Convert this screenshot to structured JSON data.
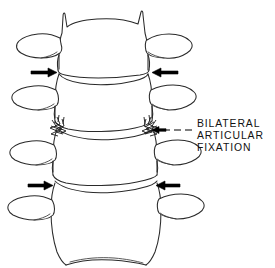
{
  "figure": {
    "background_color": "#ffffff",
    "line_color": "#2a2a2a",
    "arrow_color": "#000000",
    "text_color": "#111111",
    "vertebra_count": 4
  },
  "annotation": {
    "lines": [
      "BILATERAL",
      "ARTICULAR",
      "FIXATION"
    ],
    "line1": "BILATERAL",
    "line2": "ARTICULAR",
    "line3": "FIXATION",
    "leader": "dashed-line-to-left-arrow",
    "points_to": "right-facet-joint-fixation"
  },
  "arrows": [
    {
      "id": "upper-left",
      "direction": "right",
      "label": "upper-left-arrow",
      "level": "upper-disc-space"
    },
    {
      "id": "upper-right",
      "direction": "left",
      "label": "upper-right-arrow",
      "level": "upper-disc-space"
    },
    {
      "id": "lower-left",
      "direction": "right",
      "label": "lower-left-arrow",
      "level": "lower-disc-space"
    },
    {
      "id": "lower-right",
      "direction": "left",
      "label": "lower-right-arrow",
      "level": "lower-disc-space"
    },
    {
      "id": "caption",
      "direction": "left",
      "label": "caption-arrow",
      "level": "middle-facet-joints"
    }
  ],
  "fixation_marks": [
    {
      "id": "left-facet",
      "label": "left-articular-fixation-zigzag"
    },
    {
      "id": "right-facet",
      "label": "right-articular-fixation-zigzag"
    }
  ],
  "vertebrae": [
    {
      "id": "v1",
      "label": "vertebra-1-top"
    },
    {
      "id": "v2",
      "label": "vertebra-2"
    },
    {
      "id": "v3",
      "label": "vertebra-3"
    },
    {
      "id": "v4",
      "label": "vertebra-4-bottom"
    }
  ]
}
